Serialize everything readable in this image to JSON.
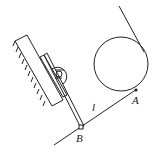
{
  "diagram": {
    "labels": {
      "A": "A",
      "B": "B",
      "l": "l"
    },
    "colors": {
      "stroke": "#222222",
      "background": "#ffffff"
    },
    "elements": [
      "inclined-wall-with-hatching",
      "block-on-wall",
      "pulley-knob",
      "slider-rail",
      "circle",
      "tangent-line",
      "string-l-from-A-to-B"
    ]
  }
}
